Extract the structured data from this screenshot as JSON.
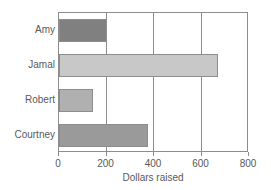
{
  "chart_data": {
    "type": "bar",
    "orientation": "horizontal",
    "title": "",
    "xlabel": "Dollars raised",
    "ylabel": "",
    "categories": [
      "Amy",
      "Jamal",
      "Robert",
      "Courtney"
    ],
    "values": [
      200,
      670,
      143,
      375
    ],
    "xlim": [
      0,
      800
    ],
    "xticks": [
      0,
      200,
      400,
      600,
      800
    ],
    "xtick_labels": [
      "0",
      "200",
      "400",
      "600",
      "800"
    ],
    "grid": "vertical",
    "legend": "none",
    "bar_colors": [
      "#808080",
      "#c8c8c8",
      "#b0b0b0",
      "#9a9a9a"
    ],
    "axis_color": "#8d8d8d",
    "text_color": "#58595b",
    "background": "#ffffff"
  }
}
